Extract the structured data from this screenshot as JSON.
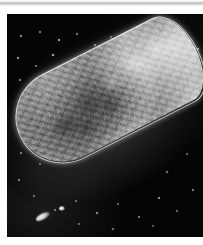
{
  "page": {
    "background_color": "#ffffff",
    "width": 203,
    "height": 245
  },
  "scan_artifact": {
    "name": "scanner-shadow-band",
    "color": "#b9b9b9",
    "position": "top-edge"
  },
  "plate": {
    "caption": "",
    "background_color": "#040404",
    "x": 7,
    "y": 14,
    "width": 196,
    "height": 223,
    "modality": "dark-field micrograph"
  },
  "specimen": {
    "label": "",
    "description": "elongated rod-shaped microorganism",
    "orientation_degrees": -27,
    "thick_end": "upper-right",
    "tapered_end": "lower-left",
    "surface": "granular",
    "rim_color": "#ffffff",
    "body_color": "#9a9a9a",
    "shadow_color": "#5a5a5a"
  },
  "background_particles": {
    "name": "speckle-field",
    "color": "#e8e8e8",
    "count": 46,
    "points": [
      {
        "x": 14,
        "y": 22,
        "r": 1.0,
        "o": 0.75
      },
      {
        "x": 33,
        "y": 18,
        "r": 0.8,
        "o": 0.55
      },
      {
        "x": 52,
        "y": 26,
        "r": 1.3,
        "o": 0.85
      },
      {
        "x": 70,
        "y": 20,
        "r": 0.9,
        "o": 0.6
      },
      {
        "x": 88,
        "y": 31,
        "r": 1.1,
        "o": 0.7
      },
      {
        "x": 104,
        "y": 23,
        "r": 0.8,
        "o": 0.5
      },
      {
        "x": 121,
        "y": 29,
        "r": 1.2,
        "o": 0.8
      },
      {
        "x": 141,
        "y": 21,
        "r": 0.9,
        "o": 0.58
      },
      {
        "x": 158,
        "y": 33,
        "r": 1.0,
        "o": 0.66
      },
      {
        "x": 176,
        "y": 24,
        "r": 0.8,
        "o": 0.52
      },
      {
        "x": 191,
        "y": 35,
        "r": 1.1,
        "o": 0.72
      },
      {
        "x": 11,
        "y": 44,
        "r": 1.2,
        "o": 0.78
      },
      {
        "x": 29,
        "y": 52,
        "r": 0.9,
        "o": 0.56
      },
      {
        "x": 46,
        "y": 41,
        "r": 1.4,
        "o": 0.88
      },
      {
        "x": 63,
        "y": 55,
        "r": 0.8,
        "o": 0.5
      },
      {
        "x": 81,
        "y": 46,
        "r": 1.0,
        "o": 0.64
      },
      {
        "x": 99,
        "y": 58,
        "r": 0.9,
        "o": 0.55
      },
      {
        "x": 116,
        "y": 44,
        "r": 1.2,
        "o": 0.76
      },
      {
        "x": 136,
        "y": 54,
        "r": 0.8,
        "o": 0.48
      },
      {
        "x": 13,
        "y": 66,
        "r": 1.0,
        "o": 0.68
      },
      {
        "x": 31,
        "y": 78,
        "r": 1.3,
        "o": 0.84
      },
      {
        "x": 49,
        "y": 70,
        "r": 0.8,
        "o": 0.5
      },
      {
        "x": 67,
        "y": 82,
        "r": 1.1,
        "o": 0.72
      },
      {
        "x": 85,
        "y": 73,
        "r": 0.9,
        "o": 0.54
      },
      {
        "x": 16,
        "y": 93,
        "r": 1.2,
        "o": 0.74
      },
      {
        "x": 36,
        "y": 101,
        "r": 0.9,
        "o": 0.56
      },
      {
        "x": 55,
        "y": 95,
        "r": 1.0,
        "o": 0.62
      },
      {
        "x": 20,
        "y": 116,
        "r": 1.5,
        "o": 0.8
      },
      {
        "x": 40,
        "y": 124,
        "r": 0.8,
        "o": 0.48
      },
      {
        "x": 14,
        "y": 139,
        "r": 1.0,
        "o": 0.64
      },
      {
        "x": 33,
        "y": 150,
        "r": 0.9,
        "o": 0.52
      },
      {
        "x": 12,
        "y": 166,
        "r": 1.1,
        "o": 0.68
      },
      {
        "x": 27,
        "y": 182,
        "r": 0.8,
        "o": 0.46
      },
      {
        "x": 48,
        "y": 196,
        "r": 1.0,
        "o": 0.6
      },
      {
        "x": 69,
        "y": 187,
        "r": 0.9,
        "o": 0.52
      },
      {
        "x": 90,
        "y": 199,
        "r": 1.2,
        "o": 0.72
      },
      {
        "x": 111,
        "y": 190,
        "r": 0.8,
        "o": 0.46
      },
      {
        "x": 132,
        "y": 203,
        "r": 1.0,
        "o": 0.62
      },
      {
        "x": 152,
        "y": 184,
        "r": 1.3,
        "o": 0.78
      },
      {
        "x": 170,
        "y": 197,
        "r": 0.9,
        "o": 0.54
      },
      {
        "x": 186,
        "y": 176,
        "r": 1.1,
        "o": 0.66
      },
      {
        "x": 160,
        "y": 158,
        "r": 1.0,
        "o": 0.6
      },
      {
        "x": 180,
        "y": 140,
        "r": 0.9,
        "o": 0.52
      },
      {
        "x": 146,
        "y": 212,
        "r": 0.8,
        "o": 0.44
      },
      {
        "x": 106,
        "y": 215,
        "r": 1.0,
        "o": 0.58
      },
      {
        "x": 72,
        "y": 210,
        "r": 0.9,
        "o": 0.5
      }
    ]
  },
  "debris_objects": [
    {
      "name": "bright-fragment-lower-left",
      "x": 28,
      "y": 199,
      "w": 16,
      "h": 7,
      "rot": -28
    },
    {
      "name": "bright-dot-lower-left",
      "x": 52,
      "y": 192,
      "w": 6,
      "h": 5,
      "rot": 0
    }
  ],
  "internal_blotches": [
    {
      "x": 30,
      "y": 46,
      "w": 30,
      "h": 20,
      "color": "rgba(40,40,40,0.55)"
    },
    {
      "x": 62,
      "y": 36,
      "w": 26,
      "h": 24,
      "color": "rgba(48,48,48,0.50)"
    },
    {
      "x": 52,
      "y": 60,
      "w": 22,
      "h": 16,
      "color": "rgba(30,30,30,0.45)"
    },
    {
      "x": 96,
      "y": 30,
      "w": 20,
      "h": 18,
      "color": "rgba(235,235,235,0.40)"
    },
    {
      "x": 124,
      "y": 22,
      "w": 24,
      "h": 20,
      "color": "rgba(245,245,245,0.45)"
    },
    {
      "x": 150,
      "y": 18,
      "w": 22,
      "h": 22,
      "color": "rgba(250,250,250,0.42)"
    },
    {
      "x": 86,
      "y": 54,
      "w": 18,
      "h": 14,
      "color": "rgba(36,36,36,0.42)"
    }
  ]
}
